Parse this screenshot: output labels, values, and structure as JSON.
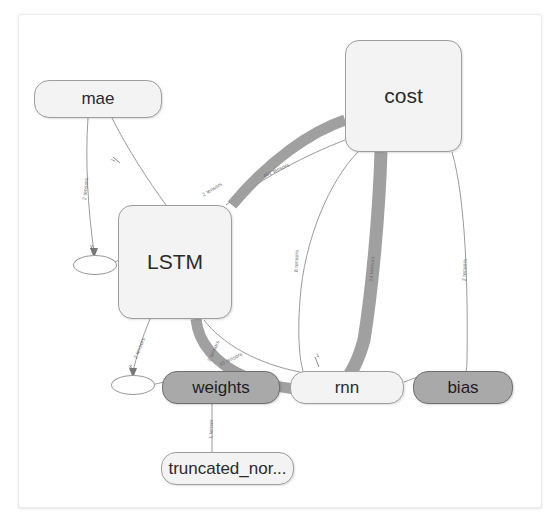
{
  "graph": {
    "title": "tensorboard-graph",
    "background": "#ffffff",
    "panel_border": "#ececec",
    "node_fill_light": "#f3f3f3",
    "node_fill_dark": "#a9a9a9",
    "node_stroke": "#9e9e9e",
    "edge_color": "#9e9e9e",
    "thick_edge_color": "#9e9e9e"
  },
  "nodes": {
    "mae": {
      "label": "mae",
      "type": "group-pill",
      "x": 34,
      "y": 80,
      "w": 128,
      "h": 38
    },
    "cost": {
      "label": "cost",
      "type": "group",
      "x": 345,
      "y": 40,
      "w": 117,
      "h": 112
    },
    "lstm": {
      "label": "LSTM",
      "type": "group",
      "x": 118,
      "y": 205,
      "w": 114,
      "h": 114
    },
    "y_summary": {
      "label": "",
      "type": "ellipse",
      "x": 73,
      "y": 255,
      "w": 44,
      "h": 20
    },
    "x_summary": {
      "label": "",
      "type": "ellipse",
      "x": 111,
      "y": 375,
      "w": 44,
      "h": 20
    },
    "weights": {
      "label": "weights",
      "type": "op-filled",
      "x": 162,
      "y": 371,
      "w": 118,
      "h": 33
    },
    "rnn": {
      "label": "rnn",
      "type": "op",
      "x": 290,
      "y": 371,
      "w": 114,
      "h": 33
    },
    "bias": {
      "label": "bias",
      "type": "op-filled",
      "x": 413,
      "y": 371,
      "w": 100,
      "h": 33
    },
    "truncated_normal": {
      "label": "truncated_nor...",
      "type": "op",
      "x": 161,
      "y": 452,
      "w": 133,
      "h": 33
    }
  },
  "edge_labels": {
    "mae_to_y": "2 tensors",
    "mae_to_lstm": "1",
    "lstm_to_cost_a": "2 tensors",
    "cost_to_lstm_b": "481 tensors",
    "cost_to_rnn_thin": "8 tensors",
    "cost_to_rnn_thick": "24 tensors",
    "cost_to_bias": "2 tensors",
    "lstm_to_x": "2 tensors",
    "lstm_to_weights": "2 tensors",
    "weights_thick": "40 tensors",
    "rnn_to_lstm": "1",
    "weights_to_truncated": "1 tensor"
  },
  "annotations": {
    "x_node_letter": "x",
    "y_node_letter": "y"
  }
}
